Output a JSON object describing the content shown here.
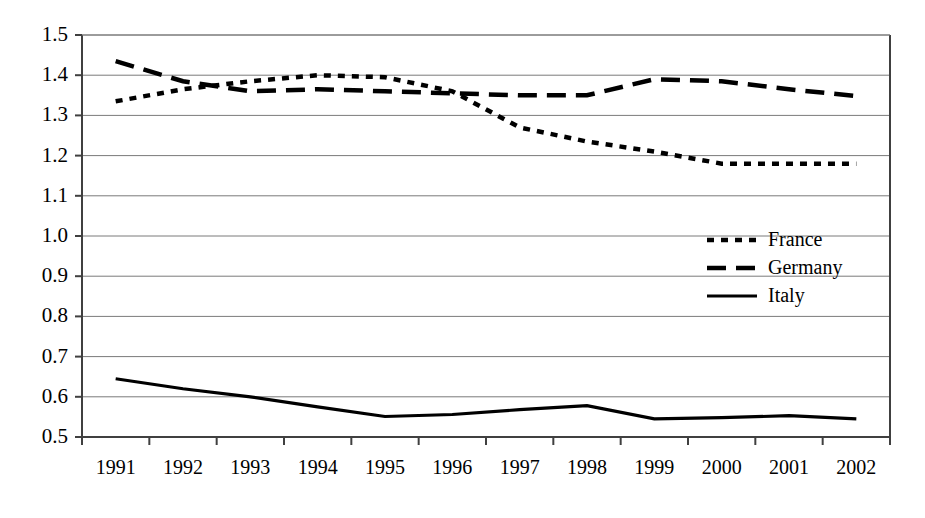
{
  "chart_data": {
    "type": "line",
    "title": "",
    "subtitle": "",
    "xlabel": "",
    "ylabel": "",
    "categories": [
      "1991",
      "1992",
      "1993",
      "1994",
      "1995",
      "1996",
      "1997",
      "1998",
      "1999",
      "2000",
      "2001",
      "2002"
    ],
    "ylim": [
      0.5,
      1.5
    ],
    "ytick_labels": [
      "1.5",
      "1.4",
      "1.3",
      "1.2",
      "1.1",
      "1.0",
      "0.9",
      "0.8",
      "0.7",
      "0.6",
      "0.5"
    ],
    "ytick_values": [
      1.5,
      1.4,
      1.3,
      1.2,
      1.1,
      1.0,
      0.9,
      0.8,
      0.7,
      0.6,
      0.5
    ],
    "grid": true,
    "grid_axis": "y",
    "legend_position": "middle-right",
    "series": [
      {
        "name": "France",
        "style": "dotted",
        "color": "#000000",
        "values": [
          1.335,
          1.365,
          1.385,
          1.4,
          1.395,
          1.36,
          1.27,
          1.235,
          1.21,
          1.18,
          1.18,
          1.18
        ]
      },
      {
        "name": "Germany",
        "style": "dashed",
        "color": "#000000",
        "values": [
          1.435,
          1.385,
          1.36,
          1.365,
          1.36,
          1.355,
          1.35,
          1.35,
          1.39,
          1.385,
          1.365,
          1.348
        ]
      },
      {
        "name": "Italy",
        "style": "solid",
        "color": "#000000",
        "values": [
          0.645,
          0.62,
          0.6,
          0.575,
          0.551,
          0.556,
          0.568,
          0.578,
          0.545,
          0.548,
          0.553,
          0.545
        ]
      }
    ]
  },
  "legend": {
    "items": [
      {
        "label": "France",
        "swatch": "dotted-line-swatch"
      },
      {
        "label": "Germany",
        "swatch": "dashed-line-swatch"
      },
      {
        "label": "Italy",
        "swatch": "solid-line-swatch"
      }
    ]
  },
  "axes": {
    "y_axis_name": "value-axis",
    "x_axis_name": "year-axis"
  }
}
